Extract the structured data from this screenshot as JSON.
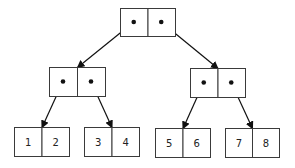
{
  "diagram": {
    "type": "binary-tree-pairs",
    "root": {
      "x": 120,
      "y": 8,
      "w": 55,
      "h": 28,
      "cells": [
        {
          "kind": "pointer"
        },
        {
          "kind": "pointer"
        }
      ]
    },
    "internal": [
      {
        "x": 49,
        "y": 67,
        "w": 56,
        "h": 29,
        "cells": [
          {
            "kind": "pointer"
          },
          {
            "kind": "pointer"
          }
        ]
      },
      {
        "x": 190,
        "y": 68,
        "w": 55,
        "h": 29,
        "cells": [
          {
            "kind": "pointer"
          },
          {
            "kind": "pointer"
          }
        ]
      }
    ],
    "leaves": [
      {
        "x": 14,
        "y": 127,
        "w": 55,
        "h": 29,
        "values": [
          "1",
          "2"
        ]
      },
      {
        "x": 84,
        "y": 127,
        "w": 55,
        "h": 29,
        "values": [
          "3",
          "4"
        ]
      },
      {
        "x": 155,
        "y": 128,
        "w": 55,
        "h": 29,
        "values": [
          "5",
          "6"
        ]
      },
      {
        "x": 225,
        "y": 128,
        "w": 54,
        "h": 29,
        "values": [
          "7",
          "8"
        ]
      }
    ]
  }
}
